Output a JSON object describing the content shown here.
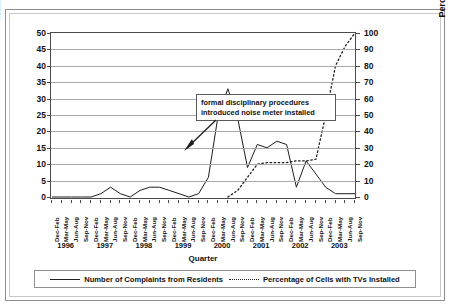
{
  "top_caption": "",
  "axes": {
    "x_title": "Quarter",
    "y_left_title": "Number of Complaints from Residents",
    "y_right_title": "Percentage of Calls with TVs Installed",
    "y_left_ticks": [
      "50",
      "45",
      "40",
      "35",
      "30",
      "25",
      "20",
      "15",
      "10",
      "5",
      "0"
    ],
    "y_right_ticks": [
      "100",
      "90",
      "80",
      "70",
      "60",
      "50",
      "40",
      "30",
      "20",
      "10",
      "0"
    ]
  },
  "annotation": {
    "line1": "formal disciplinary procedures",
    "line2": "introduced noise meter installed"
  },
  "legend": {
    "series1": "Number of Complaints from Residents",
    "series2": "Percentage of Cells with TVs Installed"
  },
  "years": [
    "1996",
    "1997",
    "1998",
    "1999",
    "2000",
    "2001",
    "2002",
    "2003"
  ],
  "quarter_labels": [
    "Dec-Feb",
    "Mar-May",
    "Jun-Aug",
    "Sep-Nov",
    "Dec-Feb",
    "Mar-May",
    "Jun-Aug",
    "Sep-Nov",
    "Dec-Feb",
    "Mar-May",
    "Jun-Aug",
    "Sep-Nov",
    "Dec-Feb",
    "Mar-May",
    "Jun-Aug",
    "Sep-Nov",
    "Dec-Feb",
    "Mar-May",
    "Jun-Aug",
    "Sep-Nov",
    "Dec-Feb",
    "Mar-May",
    "Jun-Aug",
    "Sep-Nov",
    "Dec-Feb",
    "Mar-May",
    "Jun-Aug",
    "Sep-Nov",
    "Dec-Feb",
    "Mar-May",
    "Jun-Aug",
    "Sep-Nov"
  ],
  "chart_data": {
    "type": "line",
    "title": "",
    "xlabel": "Quarter",
    "ylabel": "Number of Complaints from Residents",
    "y2label": "Percentage of Calls with TVs Installed",
    "ylim": [
      0,
      50
    ],
    "y2lim": [
      0,
      100
    ],
    "grid": true,
    "legend_position": "bottom",
    "categories": [
      "Dec-Feb 1996",
      "Mar-May 1996",
      "Jun-Aug 1996",
      "Sep-Nov 1996",
      "Dec-Feb 1997",
      "Mar-May 1997",
      "Jun-Aug 1997",
      "Sep-Nov 1997",
      "Dec-Feb 1998",
      "Mar-May 1998",
      "Jun-Aug 1998",
      "Sep-Nov 1998",
      "Dec-Feb 1999",
      "Mar-May 1999",
      "Jun-Aug 1999",
      "Sep-Nov 1999",
      "Dec-Feb 2000",
      "Mar-May 2000",
      "Jun-Aug 2000",
      "Sep-Nov 2000",
      "Dec-Feb 2001",
      "Mar-May 2001",
      "Jun-Aug 2001",
      "Sep-Nov 2001",
      "Dec-Feb 2002",
      "Mar-May 2002",
      "Jun-Aug 2002",
      "Sep-Nov 2002",
      "Dec-Feb 2003",
      "Mar-May 2003",
      "Jun-Aug 2003",
      "Sep-Nov 2003"
    ],
    "series": [
      {
        "name": "Number of Complaints from Residents",
        "style": "solid",
        "axis": "left",
        "values": [
          0,
          0,
          0,
          0,
          0,
          1,
          3,
          1,
          0,
          2,
          3,
          3,
          2,
          1,
          0,
          1,
          6,
          25,
          33,
          24,
          9,
          16,
          15,
          17,
          16,
          3,
          11,
          7,
          3,
          1,
          1,
          1
        ]
      },
      {
        "name": "Percentage of Cells with TVs Installed",
        "style": "dotted",
        "axis": "right",
        "values": [
          null,
          null,
          null,
          null,
          null,
          null,
          null,
          null,
          null,
          null,
          null,
          null,
          null,
          null,
          null,
          null,
          null,
          null,
          0,
          4,
          12,
          20,
          21,
          21,
          21,
          22,
          22,
          23,
          50,
          80,
          92,
          100
        ]
      }
    ],
    "annotations": [
      {
        "text": "formal disciplinary procedures introduced noise meter installed",
        "arrow_from": "callout-left-bottom",
        "arrow_to": "Sep-Nov 2000"
      }
    ]
  }
}
